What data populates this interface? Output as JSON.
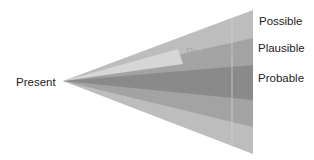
{
  "diagram": {
    "type": "futures-cone",
    "apex_label": "Present",
    "cones": [
      {
        "name": "Possible",
        "color": "#bdbdbd"
      },
      {
        "name": "Plausible",
        "color": "#a3a3a3"
      },
      {
        "name": "Probable",
        "color": "#8a8a8a"
      },
      {
        "name": "Preferable",
        "color": "#d6d6d6"
      }
    ],
    "labels": {
      "present": "Present",
      "possible": "Possible",
      "plausible": "Plausible",
      "probable": "Probable",
      "preferable": "Preferable"
    }
  }
}
